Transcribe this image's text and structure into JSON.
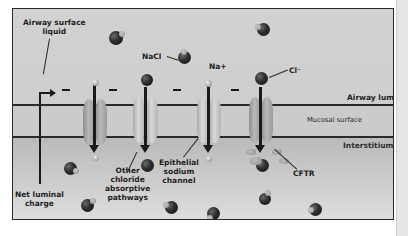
{
  "diagram": {
    "regions": {
      "airway_lumen": "Airway lumen",
      "mucosal_surface": "Mucosal surface",
      "interstitium": "Interstitium"
    },
    "labels": {
      "airway_surface_liquid_line1": "Airway surface",
      "airway_surface_liquid_line2": "liquid",
      "nacl": "NaCl",
      "na_plus": "Na+",
      "cl_minus": "Cl⁻",
      "net_luminal_line1": "Net luminal",
      "net_luminal_line2": "charge",
      "other_chloride_line1": "Other",
      "other_chloride_line2": "chloride",
      "other_chloride_line3": "absorptive",
      "other_chloride_line4": "pathways",
      "enac_line1": "Epithelial",
      "enac_line2": "sodium",
      "enac_line3": "channel",
      "cftr": "CFTR"
    },
    "charge_symbols": [
      "–",
      "–",
      "–",
      "–"
    ],
    "colors": {
      "frame_border": "#2a2a2a",
      "lumen_bg": "#d0d0d0",
      "interstitium_bg": "#bfbfbf",
      "ion_dark": "#1e1e1e",
      "ion_light": "#c0c0c0",
      "arrow": "#1a1a1a"
    }
  }
}
